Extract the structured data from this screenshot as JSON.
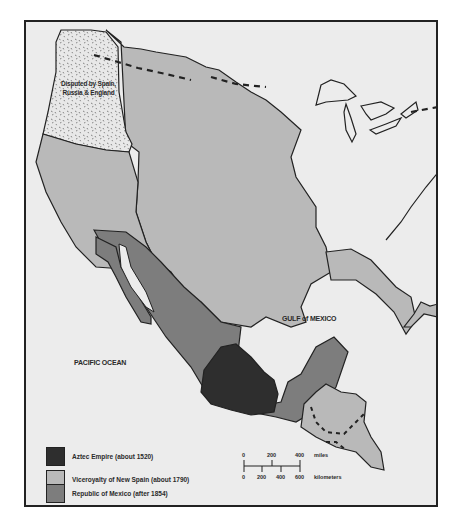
{
  "map": {
    "labels": {
      "disputed": [
        "Disputed by Spain,",
        "Russia & England"
      ],
      "gulf": "GULF of MEXICO",
      "pacific": "PACIFIC OCEAN"
    },
    "colors": {
      "background": "#ececec",
      "aztec": "#2e2e2e",
      "new_spain": "#b9b9b9",
      "mexico": "#7d7d7d",
      "disputed": "#e6e6e6",
      "border": "#222222"
    },
    "legend": {
      "items": [
        {
          "label": "Aztec Empire (about 1520)",
          "color": "#2e2e2e"
        },
        {
          "label": "Viceroyalty of New Spain (about 1790)",
          "color": "#b9b9b9"
        },
        {
          "label": "Republic of Mexico (after 1854)",
          "color": "#7d7d7d"
        }
      ]
    },
    "scale": {
      "miles_ticks": [
        "0",
        "200",
        "400"
      ],
      "miles_unit": "miles",
      "km_ticks": [
        "0",
        "200",
        "400",
        "600"
      ],
      "km_unit": "kilometers"
    }
  }
}
